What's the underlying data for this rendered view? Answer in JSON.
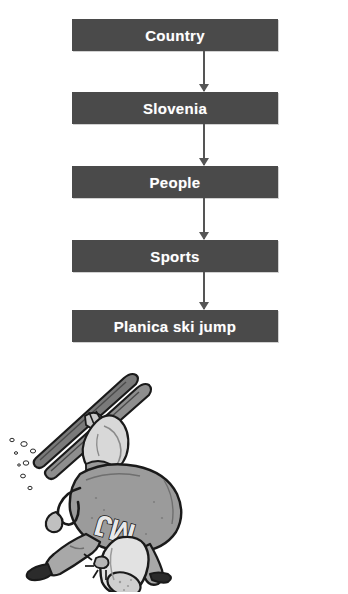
{
  "page": {
    "background_color": "#ffffff"
  },
  "flowchart": {
    "type": "vertical-flow",
    "box_color": "#4a4a4a",
    "text_color": "#ffffff",
    "arrow_color": "#555555",
    "nodes": [
      {
        "id": "country",
        "label": "Country"
      },
      {
        "id": "slovenia",
        "label": "Slovenia"
      },
      {
        "id": "people",
        "label": "People"
      },
      {
        "id": "sports",
        "label": "Sports"
      },
      {
        "id": "planica",
        "label": "Planica ski jump"
      }
    ],
    "arrows": [
      {
        "from": "country",
        "to": "slovenia",
        "direction": "down"
      },
      {
        "from": "slovenia",
        "to": "people",
        "direction": "down"
      },
      {
        "from": "people",
        "to": "sports",
        "direction": "down"
      },
      {
        "from": "sports",
        "to": "planica",
        "direction": "down"
      }
    ]
  },
  "illustration": {
    "name": "upside-down-ski-jumper-cartoon",
    "description": "Cartoon of a ski jumper tumbling head-down with crossed skis and snow spray",
    "suit_text": "MJ",
    "colors": {
      "outline": "#1a1a1a",
      "suit_body": "#9b9b9b",
      "suit_light": "#d6d6d6",
      "ski_dark": "#6e6e6e",
      "snow": "#f2f2f2"
    },
    "elements": [
      "crossed-skis",
      "helmet",
      "suit-torso",
      "arms",
      "legs",
      "ski-boots",
      "snow-spray-particles"
    ]
  }
}
